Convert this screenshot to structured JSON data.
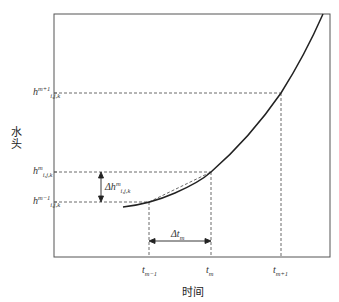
{
  "diagram": {
    "xlabel": "时间",
    "ylabel": "水头",
    "x_ticks": [
      {
        "base": "t",
        "sub": "m−1"
      },
      {
        "base": "t",
        "sub": "m"
      },
      {
        "base": "t",
        "sub": "m+1"
      }
    ],
    "y_ticks": [
      {
        "base": "h",
        "sup": "m+1",
        "sub": "i,j,k"
      },
      {
        "base": "h",
        "sup": "m",
        "sub": "i,j,k"
      },
      {
        "base": "h",
        "sup": "m−1",
        "sub": "i,j,k"
      }
    ],
    "delta_h": {
      "prefix": "Δh",
      "sup": "m",
      "sub": "i,j,k"
    },
    "delta_t": {
      "prefix": "Δt",
      "sub": "m"
    },
    "colors": {
      "line": "#222222",
      "frame": "#555555",
      "dash": "#444444"
    }
  }
}
